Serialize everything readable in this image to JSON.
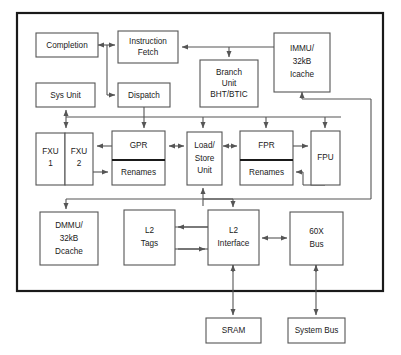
{
  "diagram": {
    "colors": {
      "chip_border": "#1a1a1a",
      "block_stroke": "#555555",
      "wire": "#555555",
      "background": "#ffffff",
      "text": "#1a1a1a"
    },
    "blocks": {
      "completion": {
        "label": "Completion",
        "lines": [
          "Completion"
        ]
      },
      "instruction_fetch": {
        "label": "Instruction Fetch",
        "lines": [
          "Instruction",
          "Fetch"
        ]
      },
      "branch_unit": {
        "label": "Branch Unit BHT/BTIC",
        "lines": [
          "Branch",
          "Unit",
          "BHT/BTIC"
        ]
      },
      "immu": {
        "label": "IMMU/ 32kB Icache",
        "lines": [
          "IMMU/",
          "32kB",
          "Icache"
        ]
      },
      "sys_unit": {
        "label": "Sys Unit",
        "lines": [
          "Sys Unit"
        ]
      },
      "dispatch": {
        "label": "Dispatch",
        "lines": [
          "Dispatch"
        ]
      },
      "fxu1": {
        "label": "FXU 1",
        "lines": [
          "FXU",
          "1"
        ]
      },
      "fxu2": {
        "label": "FXU 2",
        "lines": [
          "FXU",
          "2"
        ]
      },
      "gpr": {
        "label": "GPR",
        "lines": [
          "GPR"
        ]
      },
      "gpr_renames": {
        "label": "Renames",
        "lines": [
          "Renames"
        ]
      },
      "load_store_unit": {
        "label": "Load/ Store Unit",
        "lines": [
          "Load/",
          "Store",
          "Unit"
        ]
      },
      "fpr": {
        "label": "FPR",
        "lines": [
          "FPR"
        ]
      },
      "fpr_renames": {
        "label": "Renames",
        "lines": [
          "Renames"
        ]
      },
      "fpu": {
        "label": "FPU",
        "lines": [
          "FPU"
        ]
      },
      "dmmu": {
        "label": "DMMU/ 32kB Dcache",
        "lines": [
          "DMMU/",
          "32kB",
          "Dcache"
        ]
      },
      "l2_tags": {
        "label": "L2 Tags",
        "lines": [
          "L2",
          "Tags"
        ]
      },
      "l2_interface": {
        "label": "L2 Interface",
        "lines": [
          "L2",
          "Interface"
        ]
      },
      "bus_60x": {
        "label": "60X Bus",
        "lines": [
          "60X",
          "Bus"
        ]
      },
      "sram": {
        "label": "SRAM",
        "lines": [
          "SRAM"
        ]
      },
      "system_bus": {
        "label": "System Bus",
        "lines": [
          "System Bus"
        ]
      }
    }
  }
}
